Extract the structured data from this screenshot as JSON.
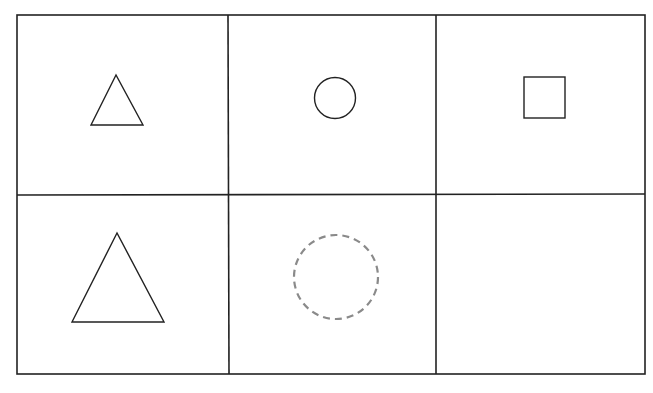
{
  "puzzle": {
    "description": "2x3 shape matrix; bottom-right cell empty, bottom-middle shows dashed placeholder circle",
    "grid": {
      "rows": 2,
      "cols": 3,
      "left": 17,
      "top": 15,
      "right": 645,
      "bottom": 374,
      "col_x": [
        17,
        228,
        436,
        645
      ],
      "row_y": [
        15,
        195,
        374
      ],
      "line_color": "#222222"
    },
    "cells": [
      {
        "row": 0,
        "col": 0,
        "shape": "triangle",
        "size": "small",
        "style": "solid"
      },
      {
        "row": 0,
        "col": 1,
        "shape": "circle",
        "size": "small",
        "style": "solid"
      },
      {
        "row": 0,
        "col": 2,
        "shape": "square",
        "size": "small",
        "style": "solid"
      },
      {
        "row": 1,
        "col": 0,
        "shape": "triangle",
        "size": "large",
        "style": "solid"
      },
      {
        "row": 1,
        "col": 1,
        "shape": "circle",
        "size": "large",
        "style": "dashed",
        "color": "#8a8a8a"
      },
      {
        "row": 1,
        "col": 2,
        "shape": "empty"
      }
    ]
  }
}
